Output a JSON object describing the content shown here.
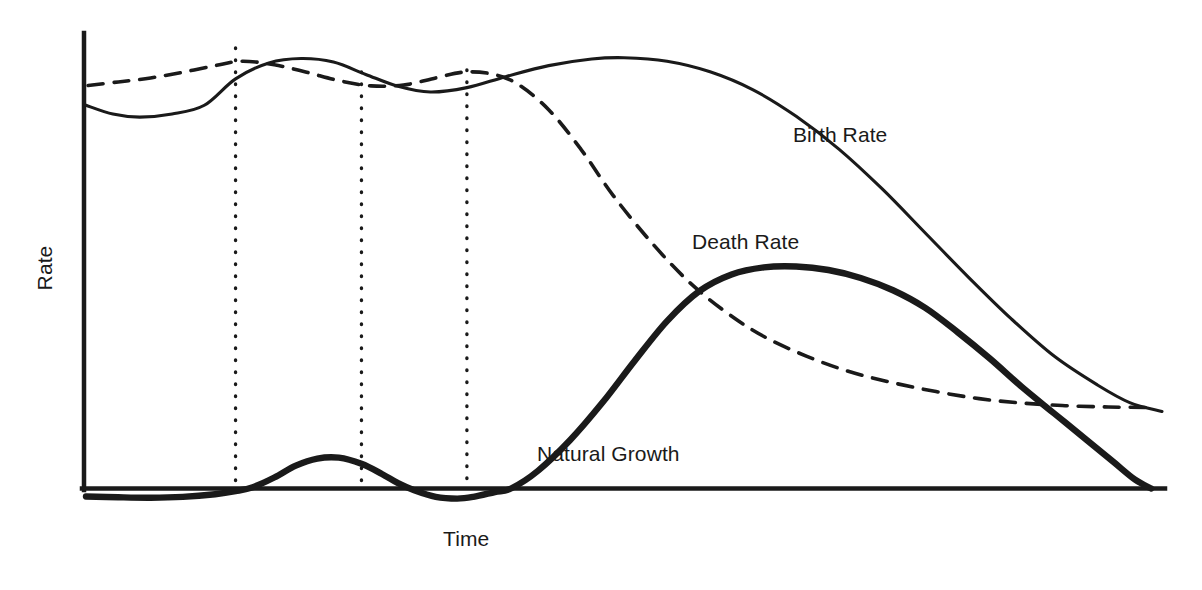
{
  "chart_data": {
    "type": "line",
    "title": "",
    "subtitle": "",
    "xlabel": "Time",
    "ylabel": "Rate",
    "xlim": [
      0,
      100
    ],
    "ylim": [
      -3,
      100
    ],
    "grid": false,
    "legend_position": "inline-annotations",
    "annotations": [
      {
        "id": "birth-rate",
        "text": "Birth Rate",
        "x": 66,
        "y": 81
      },
      {
        "id": "death-rate",
        "text": "Death Rate",
        "x": 56,
        "y": 57
      },
      {
        "id": "natural-growth",
        "text": "Natural Growth",
        "x": 42,
        "y": 10
      }
    ],
    "stage_dividers": [
      {
        "id": "divider-1",
        "x": 13.9
      },
      {
        "id": "divider-2",
        "x": 25.6
      },
      {
        "id": "divider-3",
        "x": 35.4
      }
    ],
    "series": [
      {
        "name": "Birth Rate",
        "style": "solid-thin",
        "color": "#1a1a1a",
        "points": [
          [
            0.0,
            87.0
          ],
          [
            2.5,
            85.0
          ],
          [
            5.0,
            84.3
          ],
          [
            8.0,
            85.0
          ],
          [
            11.0,
            87.0
          ],
          [
            13.9,
            93.0
          ],
          [
            17.0,
            96.6
          ],
          [
            20.0,
            97.6
          ],
          [
            23.0,
            96.8
          ],
          [
            26.0,
            94.0
          ],
          [
            29.0,
            91.3
          ],
          [
            32.0,
            90.0
          ],
          [
            35.4,
            91.0
          ],
          [
            39.0,
            93.5
          ],
          [
            43.0,
            96.0
          ],
          [
            47.0,
            97.5
          ],
          [
            50.0,
            97.8
          ],
          [
            54.0,
            97.0
          ],
          [
            58.0,
            94.6
          ],
          [
            62.0,
            90.5
          ],
          [
            66.0,
            84.5
          ],
          [
            70.0,
            77.0
          ],
          [
            74.0,
            68.0
          ],
          [
            78.0,
            58.0
          ],
          [
            82.0,
            48.0
          ],
          [
            86.0,
            38.5
          ],
          [
            90.0,
            30.0
          ],
          [
            94.0,
            23.5
          ],
          [
            97.0,
            19.5
          ],
          [
            100.0,
            17.5
          ]
        ]
      },
      {
        "name": "Death Rate",
        "style": "dashed",
        "color": "#1a1a1a",
        "points": [
          [
            0.2,
            91.5
          ],
          [
            3.0,
            92.3
          ],
          [
            6.0,
            93.2
          ],
          [
            9.0,
            94.5
          ],
          [
            12.0,
            96.0
          ],
          [
            14.5,
            97.0
          ],
          [
            17.5,
            96.2
          ],
          [
            20.5,
            94.5
          ],
          [
            23.5,
            92.6
          ],
          [
            26.5,
            91.4
          ],
          [
            29.5,
            91.6
          ],
          [
            32.5,
            93.2
          ],
          [
            35.0,
            94.5
          ],
          [
            37.5,
            94.2
          ],
          [
            40.0,
            92.0
          ],
          [
            43.0,
            86.0
          ],
          [
            46.0,
            77.0
          ],
          [
            49.0,
            66.5
          ],
          [
            52.5,
            56.0
          ],
          [
            56.0,
            47.0
          ],
          [
            59.5,
            40.0
          ],
          [
            63.0,
            34.5
          ],
          [
            67.0,
            30.0
          ],
          [
            71.0,
            26.5
          ],
          [
            75.0,
            24.0
          ],
          [
            79.0,
            22.0
          ],
          [
            83.0,
            20.4
          ],
          [
            87.0,
            19.4
          ],
          [
            91.0,
            18.8
          ],
          [
            95.0,
            18.5
          ],
          [
            98.5,
            18.4
          ]
        ]
      },
      {
        "name": "Natural Growth",
        "style": "solid-thick",
        "color": "#1a1a1a",
        "points": [
          [
            0.0,
            -1.8
          ],
          [
            3.0,
            -2.0
          ],
          [
            6.0,
            -2.1
          ],
          [
            9.0,
            -1.9
          ],
          [
            12.0,
            -1.3
          ],
          [
            13.9,
            -0.6
          ],
          [
            15.5,
            0.3
          ],
          [
            17.5,
            2.5
          ],
          [
            19.5,
            5.2
          ],
          [
            21.5,
            6.8
          ],
          [
            23.5,
            7.0
          ],
          [
            25.6,
            5.6
          ],
          [
            27.5,
            3.3
          ],
          [
            29.0,
            1.2
          ],
          [
            30.5,
            -0.4
          ],
          [
            32.5,
            -1.9
          ],
          [
            34.5,
            -2.3
          ],
          [
            36.0,
            -1.9
          ],
          [
            38.0,
            -0.8
          ],
          [
            39.5,
            0.0
          ],
          [
            42.0,
            4.0
          ],
          [
            45.0,
            11.0
          ],
          [
            48.0,
            19.5
          ],
          [
            51.0,
            29.0
          ],
          [
            54.0,
            38.0
          ],
          [
            57.0,
            44.8
          ],
          [
            60.0,
            48.6
          ],
          [
            63.0,
            50.2
          ],
          [
            66.0,
            50.4
          ],
          [
            69.0,
            49.6
          ],
          [
            72.0,
            47.8
          ],
          [
            75.0,
            45.0
          ],
          [
            78.0,
            41.0
          ],
          [
            81.0,
            35.5
          ],
          [
            84.0,
            29.5
          ],
          [
            87.0,
            23.0
          ],
          [
            90.0,
            17.0
          ],
          [
            93.0,
            11.0
          ],
          [
            95.5,
            6.0
          ],
          [
            97.5,
            2.0
          ],
          [
            99.0,
            0.0
          ]
        ]
      }
    ]
  },
  "labels": {
    "y_axis": "Rate",
    "x_axis": "Time",
    "birth_rate": "Birth Rate",
    "death_rate": "Death Rate",
    "natural_growth": "Natural Growth"
  },
  "colors": {
    "ink": "#1a1a1a",
    "background": "#ffffff"
  }
}
